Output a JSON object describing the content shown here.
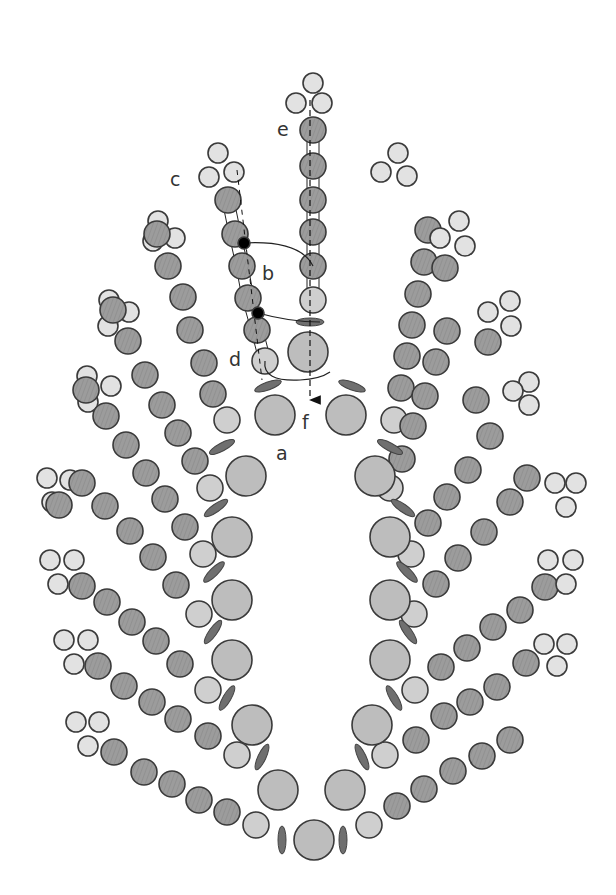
{
  "colors": {
    "outline": "#3a3a3a",
    "large": "#bdbdbd",
    "light": "#cfcfcf",
    "tip": "#e2e2e2",
    "dark": "#9c9c9c",
    "pad": "#6f6f6f",
    "dot": "#000000",
    "line": "#222222"
  },
  "labels": [
    {
      "text": "a",
      "x": 276,
      "y": 460
    },
    {
      "text": "b",
      "x": 262,
      "y": 280
    },
    {
      "text": "c",
      "x": 170,
      "y": 186
    },
    {
      "text": "d",
      "x": 229,
      "y": 366
    },
    {
      "text": "e",
      "x": 277,
      "y": 136
    },
    {
      "text": "f",
      "x": 302,
      "y": 429
    }
  ],
  "large_circles": [
    [
      275,
      415,
      20
    ],
    [
      246,
      476,
      20
    ],
    [
      232,
      537,
      20
    ],
    [
      232,
      600,
      20
    ],
    [
      232,
      660,
      20
    ],
    [
      252,
      725,
      20
    ],
    [
      278,
      790,
      20
    ],
    [
      314,
      840,
      20
    ],
    [
      346,
      415,
      20
    ],
    [
      375,
      476,
      20
    ],
    [
      390,
      537,
      20
    ],
    [
      390,
      600,
      20
    ],
    [
      390,
      660,
      20
    ],
    [
      372,
      725,
      20
    ],
    [
      345,
      790,
      20
    ],
    [
      308,
      352,
      20
    ]
  ],
  "pads": [
    [
      268,
      386,
      -20
    ],
    [
      222,
      447,
      -28
    ],
    [
      216,
      508,
      -35
    ],
    [
      214,
      572,
      -45
    ],
    [
      213,
      632,
      -55
    ],
    [
      227,
      698,
      -60
    ],
    [
      262,
      757,
      -65
    ],
    [
      282,
      840,
      90
    ],
    [
      352,
      386,
      20
    ],
    [
      390,
      447,
      28
    ],
    [
      403,
      508,
      35
    ],
    [
      407,
      572,
      45
    ],
    [
      408,
      632,
      55
    ],
    [
      394,
      698,
      60
    ],
    [
      362,
      757,
      65
    ],
    [
      343,
      840,
      90
    ],
    [
      310,
      322,
      0
    ]
  ],
  "branches": [
    {
      "light": [
        227,
        420
      ],
      "dark": [
        [
          213,
          394
        ],
        [
          204,
          363
        ],
        [
          190,
          330
        ],
        [
          183,
          297
        ],
        [
          168,
          266
        ],
        [
          157,
          234
        ]
      ],
      "tip": [
        [
          158,
          221
        ],
        [
          153,
          241
        ],
        [
          175,
          238
        ]
      ]
    },
    {
      "light": [
        210,
        488
      ],
      "dark": [
        [
          195,
          461
        ],
        [
          178,
          433
        ],
        [
          162,
          405
        ],
        [
          145,
          375
        ],
        [
          128,
          341
        ],
        [
          113,
          310
        ]
      ],
      "tip": [
        [
          109,
          300
        ],
        [
          108,
          326
        ],
        [
          129,
          312
        ]
      ]
    },
    {
      "light": [
        203,
        554
      ],
      "dark": [
        [
          185,
          527
        ],
        [
          165,
          499
        ],
        [
          146,
          473
        ],
        [
          126,
          445
        ],
        [
          106,
          416
        ],
        [
          86,
          390
        ]
      ],
      "tip": [
        [
          87,
          376
        ],
        [
          88,
          402
        ],
        [
          111,
          386
        ]
      ]
    },
    {
      "light": [
        199,
        614
      ],
      "dark": [
        [
          176,
          585
        ],
        [
          153,
          557
        ],
        [
          130,
          531
        ],
        [
          105,
          506
        ],
        [
          82,
          483
        ],
        [
          59,
          505
        ]
      ],
      "tip": [
        [
          47,
          478
        ],
        [
          70,
          480
        ],
        [
          52,
          502
        ]
      ]
    },
    {
      "light": [
        208,
        690
      ],
      "dark": [
        [
          180,
          664
        ],
        [
          156,
          641
        ],
        [
          132,
          622
        ],
        [
          107,
          602
        ],
        [
          82,
          586
        ]
      ],
      "tip": [
        [
          50,
          560
        ],
        [
          74,
          560
        ],
        [
          58,
          584
        ]
      ]
    },
    {
      "light": [
        237,
        755
      ],
      "dark": [
        [
          208,
          736
        ],
        [
          178,
          719
        ],
        [
          152,
          702
        ],
        [
          124,
          686
        ],
        [
          98,
          666
        ]
      ],
      "tip": [
        [
          64,
          640
        ],
        [
          88,
          640
        ],
        [
          74,
          664
        ]
      ]
    },
    {
      "light": [
        256,
        825
      ],
      "dark": [
        [
          227,
          812
        ],
        [
          199,
          800
        ],
        [
          172,
          784
        ],
        [
          144,
          772
        ],
        [
          114,
          752
        ]
      ],
      "tip": [
        [
          76,
          722
        ],
        [
          99,
          722
        ],
        [
          88,
          746
        ]
      ]
    },
    {
      "light": [
        394,
        420
      ],
      "dark": [
        [
          401,
          388
        ],
        [
          407,
          356
        ],
        [
          412,
          325
        ],
        [
          418,
          294
        ],
        [
          424,
          262
        ],
        [
          428,
          230
        ]
      ],
      "tip": [
        [
          398,
          153
        ],
        [
          381,
          172
        ],
        [
          407,
          176
        ]
      ]
    },
    {
      "light": [
        390,
        488
      ],
      "dark": [
        [
          402,
          459
        ],
        [
          413,
          426
        ],
        [
          425,
          396
        ],
        [
          436,
          362
        ],
        [
          447,
          331
        ],
        [
          445,
          268
        ]
      ],
      "tip": [
        [
          459,
          221
        ],
        [
          440,
          238
        ],
        [
          465,
          246
        ]
      ]
    },
    {
      "light": [
        411,
        554
      ],
      "dark": [
        [
          428,
          523
        ],
        [
          447,
          497
        ],
        [
          468,
          470
        ],
        [
          490,
          436
        ],
        [
          476,
          400
        ],
        [
          488,
          342
        ]
      ],
      "tip": [
        [
          510,
          301
        ],
        [
          488,
          312
        ],
        [
          511,
          326
        ]
      ]
    },
    {
      "light": [
        414,
        614
      ],
      "dark": [
        [
          436,
          584
        ],
        [
          458,
          558
        ],
        [
          484,
          532
        ],
        [
          510,
          502
        ],
        [
          527,
          478
        ]
      ],
      "tip": [
        [
          529,
          382
        ],
        [
          513,
          391
        ],
        [
          529,
          405
        ]
      ]
    },
    {
      "light": [
        415,
        690
      ],
      "dark": [
        [
          441,
          667
        ],
        [
          467,
          648
        ],
        [
          493,
          627
        ],
        [
          520,
          610
        ],
        [
          545,
          587
        ]
      ],
      "tip": [
        [
          555,
          483
        ],
        [
          576,
          483
        ],
        [
          566,
          507
        ]
      ]
    },
    {
      "light": [
        385,
        755
      ],
      "dark": [
        [
          416,
          740
        ],
        [
          444,
          716
        ],
        [
          470,
          702
        ],
        [
          497,
          687
        ],
        [
          526,
          663
        ]
      ],
      "tip": [
        [
          548,
          560
        ],
        [
          573,
          560
        ],
        [
          566,
          584
        ]
      ]
    },
    {
      "light": [
        369,
        825
      ],
      "dark": [
        [
          397,
          806
        ],
        [
          424,
          789
        ],
        [
          453,
          771
        ],
        [
          482,
          756
        ],
        [
          510,
          740
        ]
      ],
      "tip": [
        [
          544,
          644
        ],
        [
          567,
          644
        ],
        [
          557,
          666
        ]
      ]
    }
  ],
  "stalk_e": {
    "tip": [
      [
        313,
        83
      ],
      [
        296,
        103
      ],
      [
        322,
        103
      ]
    ],
    "dark": [
      [
        313,
        130
      ],
      [
        313,
        166
      ],
      [
        313,
        200
      ],
      [
        313,
        232
      ],
      [
        313,
        266
      ]
    ],
    "light": [
      313,
      300
    ]
  },
  "stalk_c": {
    "tip": [
      [
        218,
        153
      ],
      [
        209,
        177
      ],
      [
        234,
        172
      ]
    ],
    "dark": [
      [
        228,
        200
      ],
      [
        235,
        234
      ],
      [
        242,
        266
      ],
      [
        248,
        298
      ],
      [
        257,
        330
      ]
    ],
    "light": [
      265,
      361
    ]
  },
  "dots": [
    [
      244,
      243
    ],
    [
      258,
      313
    ]
  ]
}
